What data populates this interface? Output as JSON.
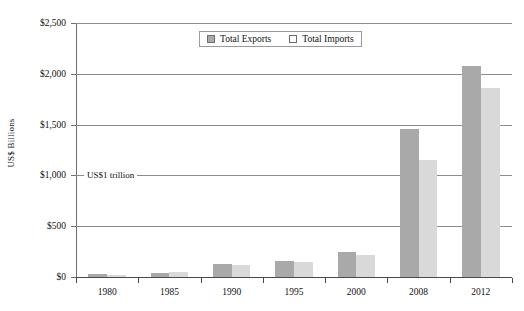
{
  "chart_data": {
    "type": "bar",
    "title": "",
    "subtitle": "",
    "xlabel": "",
    "ylabel": "US$ Billions",
    "categories": [
      "1980",
      "1985",
      "1990",
      "1995",
      "2000",
      "2008",
      "2012"
    ],
    "series": [
      {
        "name": "Total Exports",
        "color": "#a9a9a9",
        "values": [
          25,
          40,
          130,
          160,
          245,
          1460,
          2080
        ]
      },
      {
        "name": "Total Imports",
        "color": "#d9d9d9",
        "values": [
          20,
          45,
          120,
          150,
          215,
          1150,
          1860
        ]
      }
    ],
    "ylim": [
      0,
      2500
    ],
    "y_ticks": [
      0,
      500,
      1000,
      1500,
      2000,
      2500
    ],
    "y_tick_labels": [
      "$0",
      "$500",
      "$1,000",
      "$1,500",
      "$2,000",
      "$2,500"
    ],
    "grid": true,
    "legend_position": "top-center",
    "annotations": [
      {
        "text": "US$1 trillion",
        "y_value": 1000
      }
    ]
  },
  "legend": {
    "items": [
      {
        "label": "Total Exports",
        "swatch": "exports"
      },
      {
        "label": "Total Imports",
        "swatch": "imports"
      }
    ]
  }
}
